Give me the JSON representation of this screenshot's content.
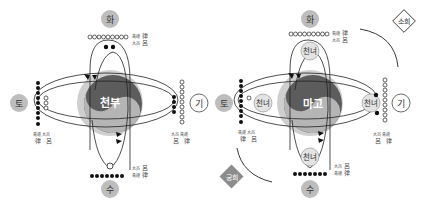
{
  "left_diagram": {
    "center_label": "천부",
    "elements": {
      "top": "화",
      "bottom": "수",
      "left": "토",
      "right": "기"
    },
    "captions": {
      "top": [
        "律",
        "呂"
      ],
      "left": [
        "律",
        "呂"
      ],
      "right": [
        "呂",
        "律"
      ],
      "bottom": [
        "呂",
        "律"
      ]
    }
  },
  "right_diagram": {
    "center_label": "마고",
    "elements": {
      "top": "화",
      "bottom": "수",
      "left": "토",
      "right": "기"
    },
    "inner_nodes": {
      "top": "천녀",
      "bottom": "천녀",
      "left": "천녀",
      "right": "천녀"
    },
    "captions": {
      "top": [
        "律",
        "呂"
      ],
      "left": [
        "律",
        "呂"
      ],
      "right": [
        "呂",
        "律"
      ],
      "bottom": [
        "呂",
        "律"
      ]
    },
    "diamonds": {
      "top_right": "소희",
      "bottom_left": "궁희"
    }
  },
  "colors": {
    "outer_ring": "#c8c8c8",
    "yin": "#5a5a5a",
    "yang": "#b4b4b4",
    "element_fill": "#bdbdbd",
    "diamond_fill": "#8c8c8c"
  }
}
